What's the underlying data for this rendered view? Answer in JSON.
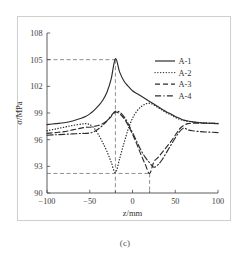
{
  "figure": {
    "caption": "(c)"
  },
  "chart_data": {
    "type": "line",
    "title": "",
    "xlabel": "z/mm",
    "ylabel": "σ/MPa",
    "xlim": [
      -100,
      100
    ],
    "ylim": [
      90,
      108
    ],
    "xticks": [
      -100,
      -50,
      0,
      50,
      100
    ],
    "xtick_labels": [
      "−100",
      "−50",
      "0",
      "50",
      "100"
    ],
    "yticks": [
      90,
      93,
      96,
      99,
      102,
      105,
      108
    ],
    "ytick_labels": [
      "90",
      "93",
      "96",
      "99",
      "102",
      "105",
      "108"
    ],
    "minor_xticks": [
      -20,
      20
    ],
    "grid": false,
    "legend_position": "upper right",
    "annotations": {
      "guide_h_peak": 105,
      "guide_h_trough": 92.2,
      "guide_v_left": -20,
      "guide_v_right": 20
    },
    "x": [
      -100,
      -90,
      -80,
      -70,
      -60,
      -55,
      -50,
      -45,
      -40,
      -35,
      -30,
      -25,
      -20,
      -15,
      -10,
      -5,
      0,
      5,
      10,
      15,
      20,
      25,
      30,
      35,
      40,
      45,
      50,
      55,
      60,
      65,
      70,
      80,
      90,
      100
    ],
    "series": [
      {
        "name": "A-1",
        "style": "solid",
        "values": [
          97.7,
          97.8,
          97.9,
          98.1,
          98.4,
          98.6,
          98.9,
          99.3,
          99.8,
          100.4,
          101.3,
          102.8,
          105.1,
          103.6,
          102.6,
          102.0,
          101.5,
          101.2,
          100.9,
          100.6,
          100.3,
          100.0,
          99.7,
          99.4,
          99.1,
          98.9,
          98.6,
          98.4,
          98.2,
          98.1,
          98.0,
          97.9,
          97.85,
          97.8
        ]
      },
      {
        "name": "A-2",
        "style": "dotted",
        "values": [
          97.0,
          97.2,
          97.4,
          97.6,
          97.75,
          97.8,
          97.7,
          97.3,
          96.6,
          95.7,
          94.7,
          93.5,
          92.3,
          93.9,
          95.6,
          97.2,
          98.4,
          99.2,
          99.7,
          100.0,
          100.1,
          99.9,
          99.6,
          99.3,
          99.0,
          98.8,
          98.5,
          98.3,
          98.15,
          98.05,
          98.0,
          97.9,
          97.85,
          97.8
        ]
      },
      {
        "name": "A-3",
        "style": "dashed",
        "values": [
          96.7,
          96.8,
          96.9,
          97.1,
          97.3,
          97.4,
          97.4,
          97.5,
          97.6,
          97.8,
          98.1,
          98.6,
          99.1,
          98.9,
          98.4,
          97.6,
          96.6,
          95.5,
          94.3,
          93.2,
          92.2,
          93.5,
          94.0,
          94.6,
          95.2,
          95.8,
          96.5,
          97.2,
          97.6,
          97.8,
          97.85,
          97.85,
          97.85,
          97.85
        ]
      },
      {
        "name": "A-4",
        "style": "dashdot",
        "values": [
          96.5,
          96.55,
          96.6,
          96.65,
          96.7,
          96.7,
          96.75,
          96.9,
          97.2,
          97.6,
          98.1,
          98.7,
          99.2,
          99.1,
          98.6,
          97.8,
          96.8,
          95.8,
          94.8,
          94.0,
          93.4,
          92.9,
          93.2,
          93.8,
          94.6,
          95.4,
          96.2,
          96.9,
          97.3,
          97.1,
          97.0,
          96.9,
          96.85,
          96.8
        ]
      }
    ],
    "legend": [
      {
        "label": "A-1",
        "style": "solid"
      },
      {
        "label": "A-2",
        "style": "dotted"
      },
      {
        "label": "A-3",
        "style": "dashed"
      },
      {
        "label": "A-4",
        "style": "dashdot"
      }
    ]
  }
}
